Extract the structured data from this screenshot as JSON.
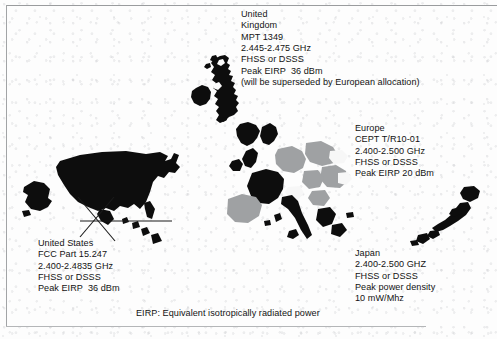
{
  "figure": {
    "caption": "EIRP: Equivalent isotropically radiated power",
    "background_color": "#fdfdfd",
    "ink_color": "#131313",
    "frame_color": "#9a9c9e"
  },
  "regions": {
    "united_kingdom": {
      "map_name": "united-kingdom-map",
      "fill": "#0d0d0d",
      "text": "United\nKingdom\nMPT 1349\n2.445-2.475 GHz\nFHSS or DSSS\nPeak EIRP  36 dBm\n(will be superseded by European allocation)",
      "lines": [
        "United",
        "Kingdom",
        "MPT 1349",
        "2.445-2.475 GHz",
        "FHSS or DSSS",
        "Peak EIRP  36 dBm",
        "(will be superseded by European allocation)"
      ],
      "standard": "MPT 1349",
      "band": "2.445-2.475 GHz",
      "modulation": "FHSS or DSSS",
      "power_label": "Peak EIRP",
      "power_value": "36 dBm",
      "note": "(will be superseded by European allocation)"
    },
    "europe": {
      "map_name": "europe-map",
      "fill_dark": "#0d0d0d",
      "fill_mid": "#9fa1a3",
      "fill_light": "#f2f2f2",
      "text": "Europe\nCEPT T/R10-01\n2.400-2.500 GHz\nFHSS or DSSS\nPeak EIRP 20 dBm",
      "lines": [
        "Europe",
        "CEPT T/R10-01",
        "2.400-2.500 GHz",
        "FHSS or DSSS",
        "Peak EIRP 20 dBm"
      ],
      "standard": "CEPT T/R10-01",
      "band": "2.400-2.500 GHz",
      "modulation": "FHSS or DSSS",
      "power_label": "Peak EIRP",
      "power_value": "20 dBm"
    },
    "united_states": {
      "map_name": "united-states-map",
      "fill": "#0d0d0d",
      "text": "United States\nFCC Part 15.247\n2.400-2.4835 GHz\nFHSS or DSSS\nPeak EIRP  36 dBm",
      "lines": [
        "United States",
        "FCC Part 15.247",
        "2.400-2.4835 GHz",
        "FHSS or DSSS",
        "Peak EIRP  36 dBm"
      ],
      "standard": "FCC Part 15.247",
      "band": "2.400-2.4835 GHz",
      "modulation": "FHSS or DSSS",
      "power_label": "Peak EIRP",
      "power_value": "36 dBm"
    },
    "japan": {
      "map_name": "japan-map",
      "fill": "#0d0d0d",
      "text": "Japan\n2.400-2.500 GHZ\nFHSS or DSSS\nPeak power density\n10 mW/Mhz",
      "lines": [
        "Japan",
        "2.400-2.500 GHZ",
        "FHSS or DSSS",
        "Peak power density",
        "10 mW/Mhz"
      ],
      "band": "2.400-2.500 GHZ",
      "modulation": "FHSS or DSSS",
      "power_label": "Peak power density",
      "power_value": "10 mW/Mhz"
    }
  }
}
